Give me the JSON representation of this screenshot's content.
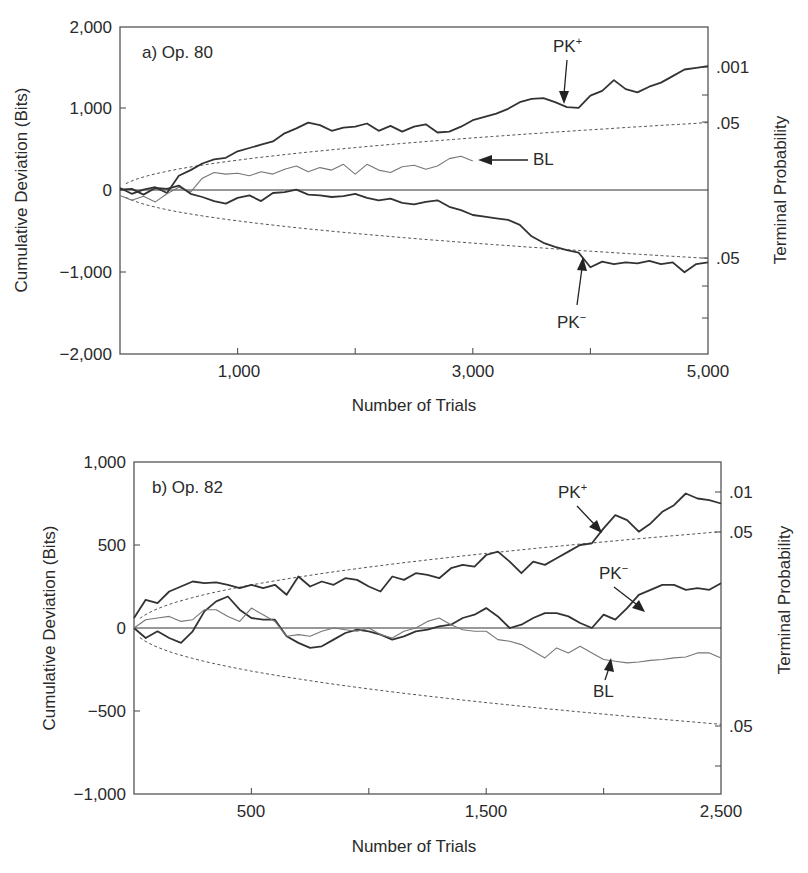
{
  "chart_data": [
    {
      "type": "line",
      "panel_label": "a) Op. 80",
      "xlabel": "Number of Trials",
      "ylabel": "Cumulative Deviation (Bits)",
      "ylabel_right": "Terminal Probability",
      "xlim": [
        0,
        5000
      ],
      "ylim": [
        -2000,
        2000
      ],
      "x_ticks": [
        1000,
        2000,
        3000,
        4000,
        5000
      ],
      "x_tick_labels": [
        "1,000",
        "3,000",
        "5,000"
      ],
      "x_tick_label_values": [
        1000,
        3000,
        5000
      ],
      "y_ticks": [
        2000,
        1000,
        0,
        -1000,
        -2000
      ],
      "y_tick_labels": [
        "2,000",
        "1,000",
        "0",
        "−1,000",
        "−2,000"
      ],
      "right_ticks": [
        {
          "y": 1500,
          "label": ".001"
        },
        {
          "y": 1000,
          "label": ""
        },
        {
          "y": 830,
          "label": ".05"
        },
        {
          "y": -830,
          "label": ".05"
        },
        {
          "y": -1150,
          "label": ""
        },
        {
          "y": -1550,
          "label": ""
        }
      ],
      "envelope": {
        "description": "p = .05 criterion (±1.645·√N·σ), dashed",
        "end_value": 830
      },
      "grid": false,
      "series": [
        {
          "name": "PK+",
          "style": "dark",
          "x": [
            0,
            100,
            200,
            300,
            400,
            500,
            600,
            700,
            800,
            900,
            1000,
            1100,
            1200,
            1300,
            1400,
            1500,
            1600,
            1700,
            1800,
            1900,
            2000,
            2100,
            2200,
            2300,
            2400,
            2500,
            2600,
            2700,
            2800,
            2900,
            3000,
            3100,
            3200,
            3300,
            3400,
            3500,
            3600,
            3700,
            3800,
            3900,
            4000,
            4100,
            4200,
            4300,
            4400,
            4500,
            4600,
            4700,
            4800,
            4900,
            5000
          ],
          "values": [
            30,
            -40,
            10,
            40,
            -30,
            180,
            250,
            330,
            380,
            400,
            480,
            520,
            560,
            600,
            700,
            760,
            830,
            800,
            730,
            770,
            780,
            820,
            730,
            790,
            720,
            780,
            810,
            710,
            720,
            780,
            860,
            900,
            940,
            1000,
            1080,
            1120,
            1130,
            1080,
            1020,
            1010,
            1160,
            1220,
            1350,
            1240,
            1200,
            1270,
            1320,
            1400,
            1480,
            1500,
            1520
          ]
        },
        {
          "name": "BL",
          "style": "light",
          "x": [
            0,
            100,
            200,
            300,
            400,
            500,
            600,
            700,
            800,
            900,
            1000,
            1100,
            1200,
            1300,
            1400,
            1500,
            1600,
            1700,
            1800,
            1900,
            2000,
            2100,
            2200,
            2300,
            2400,
            2500,
            2600,
            2700,
            2800,
            2900,
            3000
          ],
          "values": [
            -60,
            -120,
            -70,
            -140,
            -40,
            40,
            -20,
            150,
            220,
            200,
            210,
            180,
            230,
            200,
            260,
            300,
            230,
            280,
            250,
            320,
            200,
            320,
            250,
            220,
            290,
            310,
            260,
            300,
            390,
            420,
            360
          ]
        },
        {
          "name": "PK−",
          "style": "dark",
          "x": [
            0,
            100,
            200,
            300,
            400,
            500,
            600,
            700,
            800,
            900,
            1000,
            1100,
            1200,
            1300,
            1400,
            1500,
            1600,
            1700,
            1800,
            1900,
            2000,
            2100,
            2200,
            2300,
            2400,
            2500,
            2600,
            2700,
            2800,
            2900,
            3000,
            3100,
            3200,
            3300,
            3400,
            3500,
            3600,
            3700,
            3800,
            3900,
            4000,
            4100,
            4200,
            4300,
            4400,
            4500,
            4600,
            4700,
            4800,
            4900,
            5000
          ],
          "values": [
            10,
            20,
            -50,
            30,
            20,
            60,
            -40,
            -80,
            -130,
            -160,
            -90,
            -60,
            -130,
            -30,
            -20,
            10,
            -50,
            -60,
            -80,
            -70,
            -40,
            -90,
            -120,
            -100,
            -150,
            -170,
            -140,
            -120,
            -200,
            -240,
            -300,
            -320,
            -340,
            -360,
            -420,
            -560,
            -640,
            -690,
            -730,
            -760,
            -940,
            -870,
            -900,
            -880,
            -890,
            -860,
            -900,
            -880,
            -1000,
            -900,
            -880
          ]
        }
      ],
      "annotations": [
        {
          "text": "PK+",
          "target_x": 3780,
          "target_y": 1090
        },
        {
          "text": "BL",
          "target_x": 2750,
          "target_y": 390
        },
        {
          "text": "PK−",
          "target_x": 3880,
          "target_y": -800
        }
      ]
    },
    {
      "type": "line",
      "panel_label": "b) Op. 82",
      "xlabel": "Number of Trials",
      "ylabel": "Cumulative Deviation (Bits)",
      "ylabel_right": "Terminal Probability",
      "xlim": [
        0,
        2500
      ],
      "ylim": [
        -1000,
        1000
      ],
      "x_ticks": [
        500,
        1000,
        1500,
        2000,
        2500
      ],
      "x_tick_labels": [
        "500",
        "1,500",
        "2,500"
      ],
      "x_tick_label_values": [
        500,
        1500,
        2500
      ],
      "y_ticks": [
        1000,
        500,
        0,
        -500,
        -1000
      ],
      "y_tick_labels": [
        "1,000",
        "500",
        "0",
        "−500",
        "−1,000"
      ],
      "right_ticks": [
        {
          "y": 750,
          "label": ".01"
        },
        {
          "y": 580,
          "label": ".05"
        },
        {
          "y": -590,
          "label": ".05"
        },
        {
          "y": -830,
          "label": ""
        }
      ],
      "envelope": {
        "description": "p = .05 criterion, dashed",
        "end_value": 580
      },
      "grid": false,
      "series": [
        {
          "name": "PK+",
          "style": "dark",
          "x": [
            0,
            50,
            100,
            150,
            200,
            250,
            300,
            350,
            400,
            450,
            500,
            550,
            600,
            650,
            700,
            750,
            800,
            850,
            900,
            950,
            1000,
            1050,
            1100,
            1150,
            1200,
            1250,
            1300,
            1350,
            1400,
            1450,
            1500,
            1550,
            1600,
            1650,
            1700,
            1750,
            1800,
            1850,
            1900,
            1950,
            2000,
            2050,
            2100,
            2150,
            2200,
            2250,
            2300,
            2350,
            2400,
            2450,
            2500
          ],
          "values": [
            60,
            170,
            150,
            220,
            250,
            280,
            270,
            275,
            260,
            240,
            260,
            240,
            260,
            200,
            310,
            250,
            280,
            260,
            300,
            290,
            250,
            220,
            310,
            290,
            330,
            320,
            300,
            360,
            380,
            370,
            440,
            460,
            400,
            330,
            400,
            380,
            420,
            460,
            500,
            510,
            600,
            680,
            650,
            580,
            630,
            700,
            740,
            810,
            780,
            770,
            750
          ]
        },
        {
          "name": "PK−",
          "style": "dark",
          "x": [
            0,
            50,
            100,
            150,
            200,
            250,
            300,
            350,
            400,
            450,
            500,
            550,
            600,
            650,
            700,
            750,
            800,
            850,
            900,
            950,
            1000,
            1050,
            1100,
            1150,
            1200,
            1250,
            1300,
            1350,
            1400,
            1450,
            1500,
            1550,
            1600,
            1650,
            1700,
            1750,
            1800,
            1850,
            1900,
            1950,
            2000,
            2050,
            2100,
            2150,
            2200,
            2250,
            2300,
            2350,
            2400,
            2450,
            2500
          ],
          "values": [
            0,
            -60,
            -20,
            -60,
            -90,
            -20,
            100,
            160,
            190,
            110,
            60,
            50,
            50,
            -50,
            -90,
            -120,
            -110,
            -70,
            -30,
            -10,
            -20,
            -40,
            -70,
            -50,
            -20,
            -10,
            10,
            20,
            60,
            80,
            120,
            70,
            0,
            20,
            60,
            90,
            90,
            70,
            30,
            0,
            80,
            50,
            120,
            200,
            230,
            260,
            260,
            230,
            240,
            230,
            270
          ]
        },
        {
          "name": "BL",
          "style": "light",
          "x": [
            0,
            50,
            100,
            150,
            200,
            250,
            300,
            350,
            400,
            450,
            500,
            550,
            600,
            650,
            700,
            750,
            800,
            850,
            900,
            950,
            1000,
            1050,
            1100,
            1150,
            1200,
            1250,
            1300,
            1350,
            1400,
            1450,
            1500,
            1550,
            1600,
            1650,
            1700,
            1750,
            1800,
            1850,
            1900,
            1950,
            2000,
            2050,
            2100,
            2150,
            2200,
            2250,
            2300,
            2350,
            2400,
            2450,
            2500
          ],
          "values": [
            0,
            50,
            60,
            70,
            40,
            50,
            110,
            110,
            70,
            40,
            120,
            80,
            40,
            -50,
            -40,
            -50,
            -20,
            0,
            -10,
            -20,
            0,
            -40,
            -60,
            -20,
            0,
            40,
            60,
            20,
            -10,
            -20,
            -20,
            -70,
            -80,
            -100,
            -140,
            -180,
            -120,
            -150,
            -110,
            -150,
            -190,
            -200,
            -210,
            -205,
            -195,
            -190,
            -180,
            -175,
            -150,
            -150,
            -180
          ]
        }
      ],
      "annotations": [
        {
          "text": "PK+",
          "target_x": 1940,
          "target_y": 570
        },
        {
          "text": "PK−",
          "target_x": 2070,
          "target_y": 130
        },
        {
          "text": "BL",
          "target_x": 1930,
          "target_y": -180
        }
      ]
    }
  ],
  "labels": {
    "a": {
      "panel": "a) Op. 80",
      "y_title": "Cumulative Deviation (Bits)",
      "x_title": "Number of Trials",
      "right_title": "Terminal Probability",
      "y_ticks": [
        "2,000",
        "1,000",
        "0",
        "−1,000",
        "−2,000"
      ],
      "x_ticks": [
        "1,000",
        "3,000",
        "5,000"
      ],
      "right_labels": [
        ".001",
        ".05",
        ".05"
      ],
      "ann_pkplus": "PK",
      "ann_pkminus": "PK",
      "ann_bl": "BL",
      "sup_plus": "+",
      "sup_minus": "−"
    },
    "b": {
      "panel": "b) Op. 82",
      "y_title": "Cumulative Deviation (Bits)",
      "x_title": "Number of Trials",
      "right_title": "Terminal Probability",
      "y_ticks": [
        "1,000",
        "500",
        "0",
        "−500",
        "−1,000"
      ],
      "x_ticks": [
        "500",
        "1,500",
        "2,500"
      ],
      "right_labels": [
        ".01",
        ".05",
        ".05"
      ],
      "ann_pkplus": "PK",
      "ann_pkminus": "PK",
      "ann_bl": "BL",
      "sup_plus": "+",
      "sup_minus": "−"
    }
  }
}
